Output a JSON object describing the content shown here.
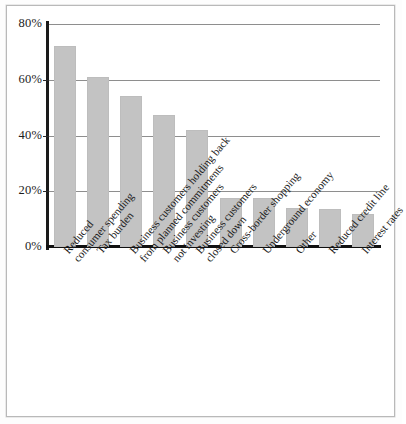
{
  "figure": {
    "background_color": "#ffffff",
    "frame_color": "#b9b9b9",
    "axis_color": "#111111",
    "grid_color": "#8e8e8e",
    "bar_color": "#c3c3c3"
  },
  "chart_data": {
    "type": "bar",
    "title": "",
    "subtitle": "",
    "xlabel": "",
    "ylabel": "",
    "ylim": [
      0,
      80
    ],
    "ytick_labels": [
      "80%",
      "60%",
      "40%",
      "20%",
      "0%"
    ],
    "ytick_values": [
      80,
      60,
      40,
      20,
      0
    ],
    "grid": true,
    "grid_axis": "y",
    "legend": false,
    "legend_position": "none",
    "orientation": "vertical",
    "value_unit": "%",
    "categories": [
      "Reduced consumer spending",
      "Tax burden",
      "Business customers holding back from planned commitments",
      "Business customers not investing",
      "Business customers closed down",
      "Cross-border shopping",
      "Underground economy",
      "Other",
      "Reduced credit line",
      "Interest rates"
    ],
    "category_lines": [
      [
        "Reduced",
        "consumer spending"
      ],
      [
        "Tax burden"
      ],
      [
        "Business customers holding back",
        "from planned commitments"
      ],
      [
        "Business customers",
        "not investing"
      ],
      [
        "Business customers",
        "closed down"
      ],
      [
        "Cross-border shopping"
      ],
      [
        "Underground economy"
      ],
      [
        "Other"
      ],
      [
        "Reduced credit line"
      ],
      [
        "Interest rates"
      ]
    ],
    "values": [
      72,
      61,
      54,
      47.5,
      42,
      17.5,
      17.5,
      14,
      13.5,
      12
    ]
  }
}
